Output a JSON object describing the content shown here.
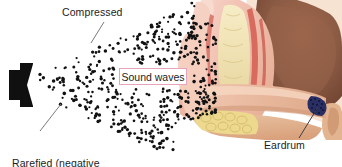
{
  "figure": {
    "width": 342,
    "height": 167,
    "background_color": "#ffffff"
  },
  "labels": {
    "compressed": "Compressed",
    "rarefied_line1": "Rarefied (negative",
    "rarefied_line2": "pressure)",
    "sound_waves": "Sound waves",
    "eardrum": "Eardrum"
  },
  "callout_box": {
    "text": "Sound waves",
    "border_color": "#e8a3bd",
    "fill_color": "#ffffff",
    "x": 119,
    "y": 68,
    "width": 68,
    "height": 17
  },
  "leader_lines": [
    {
      "name": "compressed-leader",
      "x1": 104,
      "y1": 22,
      "x2": 91,
      "y2": 43,
      "color": "#7a7a7a"
    },
    {
      "name": "rarefied-leader",
      "x1": 40,
      "y1": 131,
      "x2": 61,
      "y2": 104,
      "color": "#7a7a7a"
    },
    {
      "name": "eardrum-leader",
      "x1": 299,
      "y1": 138,
      "x2": 318,
      "y2": 108,
      "color": "#4a4a4a"
    }
  ],
  "speaker": {
    "name": "loudspeaker",
    "color": "#101010",
    "x": 8,
    "y": 62,
    "width": 26,
    "height": 46
  },
  "dot_field": {
    "name": "air-particle-dots",
    "dot_color": "#121212",
    "description": "Cone of dots expanding rightward from the speaker, dense near the ear",
    "dot_count": 470
  },
  "anatomy_colors": {
    "outer_flesh_pink": "#f2c3b4",
    "pinna_pale_pink": "#f6d5cb",
    "canal_tan": "#e8b497",
    "bone_cream": "#f0e3b4",
    "cartilage_yellow": "#edd98e",
    "vessel_red": "#d86a5e",
    "deep_brown": "#8b5a43",
    "light_brown": "#c08d6e",
    "eardrum_navy": "#2a2f63",
    "skin_shadow": "#d9a58c"
  },
  "palette": {
    "text_color": "#1c1c1c",
    "accent_pink": "#e8a3bd",
    "leader_gray": "#7a7a7a"
  }
}
